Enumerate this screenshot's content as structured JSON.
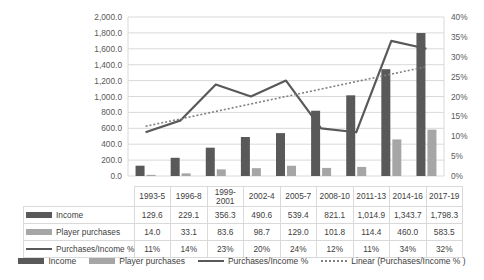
{
  "chart_data": {
    "type": "bar",
    "title": "",
    "xlabel": "",
    "ylabel": "",
    "grid": true,
    "legend_position": "bottom",
    "categories": [
      "1993-5",
      "1996-8",
      "1999-2001",
      "2002-4",
      "2005-7",
      "2008-10",
      "2011-13",
      "2014-16",
      "2017-19"
    ],
    "ylim": [
      0,
      2000
    ],
    "y2lim": [
      0,
      0.4
    ],
    "yticks": [
      "0.0",
      "200.0",
      "400.0",
      "600.0",
      "800.0",
      "1,000.0",
      "1,200.0",
      "1,400.0",
      "1,600.0",
      "1,800.0",
      "2,000.0"
    ],
    "y2ticks": [
      "0%",
      "5%",
      "10%",
      "15%",
      "20%",
      "25%",
      "30%",
      "35%",
      "40%"
    ],
    "series": [
      {
        "name": "Income",
        "type": "bar",
        "axis": "left",
        "color": "#595959",
        "values": [
          129.6,
          229.1,
          356.3,
          490.6,
          539.4,
          821.1,
          1014.9,
          1343.7,
          1798.3
        ],
        "labels": [
          "129.6",
          "229.1",
          "356.3",
          "490.6",
          "539.4",
          "821.1",
          "1,014.9",
          "1,343.7",
          "1,798.3"
        ]
      },
      {
        "name": "Player purchases",
        "type": "bar",
        "axis": "left",
        "color": "#a6a6a6",
        "values": [
          14.0,
          33.1,
          83.6,
          98.7,
          129.0,
          101.8,
          114.4,
          460.0,
          583.5
        ],
        "labels": [
          "14.0",
          "33.1",
          "83.6",
          "98.7",
          "129.0",
          "101.8",
          "114.4",
          "460.0",
          "583.5"
        ]
      },
      {
        "name": "Purchases/Income %",
        "type": "line",
        "axis": "right",
        "color": "#595959",
        "values": [
          0.11,
          0.14,
          0.23,
          0.2,
          0.24,
          0.12,
          0.11,
          0.34,
          0.32
        ],
        "labels": [
          "11%",
          "14%",
          "23%",
          "20%",
          "24%",
          "12%",
          "11%",
          "34%",
          "32%"
        ]
      },
      {
        "name": "Linear (Purchases/Income % )",
        "type": "trendline",
        "axis": "right",
        "color": "#808080",
        "start": 0.125,
        "end": 0.275
      }
    ]
  },
  "table": {
    "row_labels": [
      "Income",
      "Player purchases",
      "Purchases/Income %"
    ],
    "columns": [
      "1993-5",
      "1996-8",
      "1999-2001",
      "2002-4",
      "2005-7",
      "2008-10",
      "2011-13",
      "2014-16",
      "2017-19"
    ],
    "rows": [
      [
        "129.6",
        "229.1",
        "356.3",
        "490.6",
        "539.4",
        "821.1",
        "1,014.9",
        "1,343.7",
        "1,798.3"
      ],
      [
        "14.0",
        "33.1",
        "83.6",
        "98.7",
        "129.0",
        "101.8",
        "114.4",
        "460.0",
        "583.5"
      ],
      [
        "11%",
        "14%",
        "23%",
        "20%",
        "24%",
        "12%",
        "11%",
        "34%",
        "32%"
      ]
    ]
  },
  "legend": {
    "items": [
      "Income",
      "Player purchases",
      "Purchases/Income %",
      "Linear (Purchases/Income % )"
    ]
  }
}
